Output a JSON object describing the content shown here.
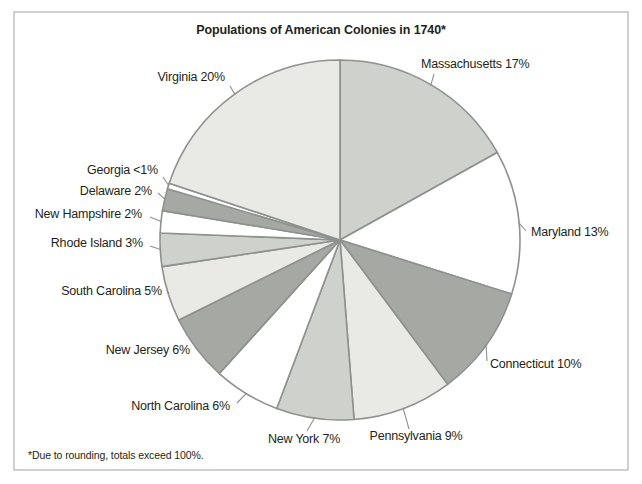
{
  "title": "Populations of American Colonies in 1740*",
  "footnote": "*Due to rounding, totals exceed 100%.",
  "palette": {
    "white": "#ffffff",
    "light": "#e9eae6",
    "medium": "#cfd1cd",
    "dark": "#a6a8a4",
    "outline": "#8e918d",
    "frame_border": "#b0b2ae",
    "text": "#231f20"
  },
  "chart_data": {
    "type": "pie",
    "title": "Populations of American Colonies in 1740*",
    "start_angle_deg": 0,
    "direction": "clockwise",
    "legend_position": "none",
    "labels_style": "outside-with-leader-lines",
    "footnote": "*Due to rounding, totals exceed 100%.",
    "slices": [
      {
        "name": "Massachusetts",
        "pct_label": "17%",
        "value": 17,
        "shade": "medium"
      },
      {
        "name": "Maryland",
        "pct_label": "13%",
        "value": 13,
        "shade": "white"
      },
      {
        "name": "Connecticut",
        "pct_label": "10%",
        "value": 10,
        "shade": "dark"
      },
      {
        "name": "Pennsylvania",
        "pct_label": "9%",
        "value": 9,
        "shade": "light"
      },
      {
        "name": "New York",
        "pct_label": "7%",
        "value": 7,
        "shade": "medium"
      },
      {
        "name": "North Carolina",
        "pct_label": "6%",
        "value": 6,
        "shade": "white"
      },
      {
        "name": "New Jersey",
        "pct_label": "6%",
        "value": 6,
        "shade": "dark"
      },
      {
        "name": "South Carolina",
        "pct_label": "5%",
        "value": 5,
        "shade": "light"
      },
      {
        "name": "Rhode Island",
        "pct_label": "3%",
        "value": 3,
        "shade": "medium"
      },
      {
        "name": "New Hampshire",
        "pct_label": "2%",
        "value": 2,
        "shade": "white"
      },
      {
        "name": "Delaware",
        "pct_label": "2%",
        "value": 2,
        "shade": "dark"
      },
      {
        "name": "Georgia",
        "pct_label": "<1%",
        "value": 0.5,
        "shade": "white"
      },
      {
        "name": "Virginia",
        "pct_label": "20%",
        "value": 20,
        "shade": "light"
      }
    ]
  }
}
